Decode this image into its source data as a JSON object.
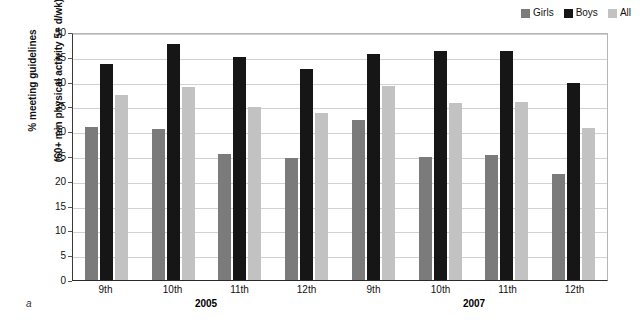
{
  "chart_data": {
    "type": "bar",
    "title": "",
    "xlabel": "",
    "ylabel": "% meeting guidelines (60+ min physical activity 5+ d/wk)",
    "ylabel_line1": "% meeting guidelines",
    "ylabel_line2": "(60+ min physical activity 5+ d/wk)",
    "ylim": [
      0,
      50
    ],
    "ytick_step": 5,
    "yticks": [
      50,
      45,
      40,
      35,
      30,
      25,
      20,
      15,
      10,
      5,
      0
    ],
    "grid": true,
    "legend_position": "top-right",
    "categories": [
      "9th",
      "10th",
      "11th",
      "12th",
      "9th",
      "10th",
      "11th",
      "12th"
    ],
    "group_labels": [
      "2005",
      "2007"
    ],
    "groups_per_label": 4,
    "series": [
      {
        "name": "Girls",
        "color": "#7b7b7b",
        "values": [
          30.8,
          30.4,
          25.4,
          24.5,
          32.2,
          24.8,
          25.3,
          21.3
        ]
      },
      {
        "name": "Boys",
        "color": "#161616",
        "values": [
          43.6,
          47.5,
          44.9,
          42.5,
          45.5,
          46.1,
          46.2,
          39.8
        ]
      },
      {
        "name": "All",
        "color": "#c2c2c2",
        "values": [
          37.3,
          38.9,
          34.9,
          33.6,
          39.1,
          35.7,
          35.8,
          30.6
        ]
      }
    ],
    "panel_label": "a"
  },
  "legend": {
    "items": [
      {
        "label": "Girls",
        "color": "#7b7b7b"
      },
      {
        "label": "Boys",
        "color": "#161616"
      },
      {
        "label": "All",
        "color": "#c2c2c2"
      }
    ]
  }
}
